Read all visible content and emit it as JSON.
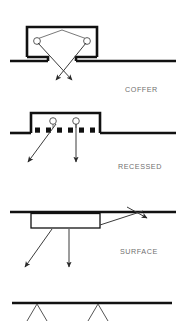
{
  "figure": {
    "background_color": "#ffffff",
    "line_color": "#111111",
    "ray_color": "#3b3b3b",
    "label_color": "#6f6f6f",
    "width": 186,
    "height": 321
  },
  "panels": [
    {
      "id": "coffer",
      "label": "COFFER",
      "label_x": 125,
      "label_y": 92,
      "ceiling_y": 57,
      "ceiling_left_x1": 10,
      "ceiling_left_x2": 48,
      "ceiling_right_x1": 72,
      "ceiling_right_x2": 176,
      "recess_left_x": 27,
      "recess_right_x": 97,
      "recess_top_y": 27,
      "lamp_left_cx": 37,
      "lamp_left_cy": 40,
      "lamp_right_cx": 87,
      "lamp_right_cy": 40,
      "lamp_radius": 3.4,
      "rays": [
        {
          "x1": 37,
          "y1": 40,
          "x2": 72,
          "y2": 81
        },
        {
          "x1": 87,
          "y1": 40,
          "x2": 57,
          "y2": 81
        }
      ]
    },
    {
      "id": "recessed",
      "label": "RECESSED",
      "label_x": 118,
      "label_y": 169,
      "ceiling_y": 133,
      "ceiling_left_x1": 10,
      "ceiling_left_x2": 31,
      "ceiling_right_x1": 100,
      "ceiling_right_x2": 176,
      "recess_left_x": 31,
      "recess_right_x": 100,
      "recess_top_y": 113,
      "louver_y": 130,
      "louver_size": 5,
      "louvers_x": [
        35,
        46,
        57,
        68,
        79,
        90
      ],
      "lamp_left_cx": 53,
      "lamp_left_cy": 122,
      "lamp_right_cx": 76,
      "lamp_right_cy": 122,
      "lamp_radius": 3.3,
      "rays": [
        {
          "x1": 53,
          "y1": 124,
          "x2": 29,
          "y2": 163
        },
        {
          "x1": 76,
          "y1": 124,
          "x2": 76,
          "y2": 163
        }
      ]
    },
    {
      "id": "surface",
      "label": "SURFACE",
      "label_x": 120,
      "label_y": 254,
      "ceiling_y": 212,
      "ceiling_x1": 10,
      "ceiling_x2": 176,
      "box_left_x": 31,
      "box_right_x": 100,
      "box_top_y": 213,
      "box_bottom_y": 228,
      "rays": [
        {
          "x1": 52,
          "y1": 229,
          "x2": 24,
          "y2": 268
        },
        {
          "x1": 69,
          "y1": 229,
          "x2": 69,
          "y2": 268
        },
        {
          "x1": 100,
          "y1": 224,
          "x2": 144,
          "y2": 211
        }
      ]
    },
    {
      "id": "pendant-partial",
      "label": "",
      "ceiling_y": 303,
      "ceiling_x1": 12,
      "ceiling_x2": 172,
      "stems": [
        {
          "apex_x": 37,
          "apex_y": 303,
          "left_x": 27,
          "right_x": 47,
          "bottom_y": 321
        },
        {
          "apex_x": 98,
          "apex_y": 303,
          "left_x": 88,
          "right_x": 108,
          "bottom_y": 321
        }
      ]
    }
  ]
}
